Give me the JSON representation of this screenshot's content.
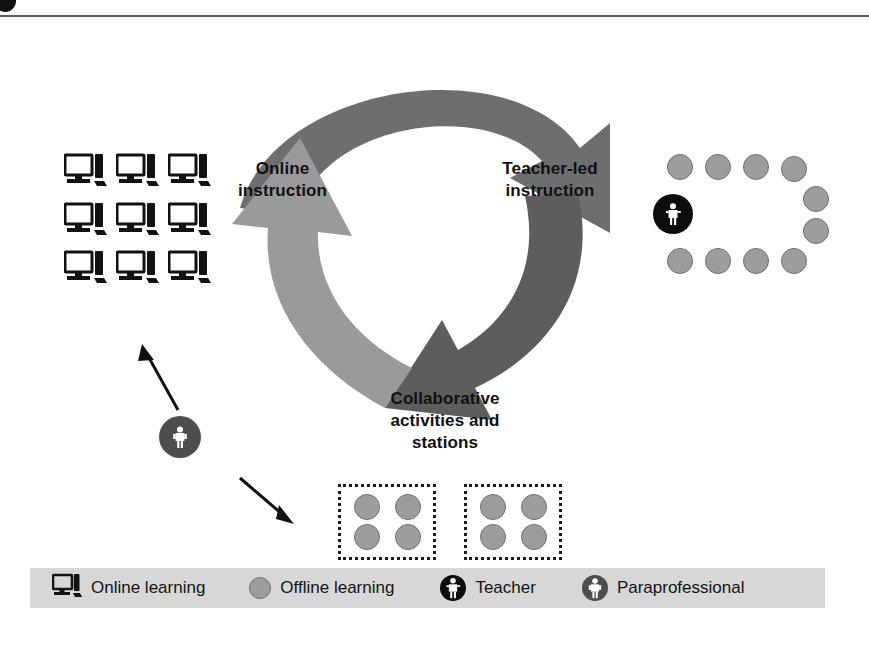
{
  "page": {
    "background": "#ffffff",
    "rule_color": "#5a5a64"
  },
  "diagram": {
    "nodes": [
      {
        "id": "online",
        "label": "Online\ninstruction",
        "label_line1": "Online",
        "label_line2": "instruction"
      },
      {
        "id": "teacher",
        "label": "Teacher-led\ninstruction",
        "label_line1": "Teacher-led",
        "label_line2": "instruction"
      },
      {
        "id": "collab",
        "label": "Collaborative\nactivities and\nstations",
        "label_line1": "Collaborative",
        "label_line2": "activities and",
        "label_line3": "stations"
      }
    ],
    "arrows": [
      {
        "name": "online-to-teacher",
        "from": "online",
        "to": "teacher",
        "color": "#6e6e6e"
      },
      {
        "name": "teacher-to-collab",
        "from": "teacher",
        "to": "collab",
        "color": "#5d5d5d"
      },
      {
        "name": "collab-to-online",
        "from": "collab",
        "to": "online",
        "color": "#9a9a9a"
      }
    ],
    "groups": {
      "online_computers": {
        "name": "computer-grid",
        "rows": 3,
        "cols": 3,
        "count": 9,
        "icon": "monitor-icon"
      },
      "teacher_led_circle": {
        "name": "horseshoe-seating",
        "student_count": 10,
        "student_color": "#9d9d9d",
        "teacher": {
          "icon": "teacher-icon",
          "color": "#0d0d0d"
        }
      },
      "stations": {
        "name": "collaborative-stations",
        "station_count": 2,
        "seats_per_station": 4,
        "seat_color": "#9d9d9d",
        "border_style": "dotted"
      },
      "paraprofessional": {
        "name": "paraprofessional-marker",
        "icon": "paraprofessional-icon",
        "color": "#4d4d4d",
        "arrow_up_target": "online_computers",
        "arrow_down_target": "stations"
      }
    }
  },
  "legend": {
    "background": "#d7d7d7",
    "items": [
      {
        "icon": "monitor-icon",
        "label": "Online learning",
        "color": "#141414"
      },
      {
        "icon": "circle-icon",
        "label": "Offline learning",
        "color": "#9d9d9d"
      },
      {
        "icon": "teacher-icon",
        "label": "Teacher",
        "color": "#0d0d0d"
      },
      {
        "icon": "paraprofessional-icon",
        "label": "Paraprofessional",
        "color": "#4d4d4d"
      }
    ]
  }
}
